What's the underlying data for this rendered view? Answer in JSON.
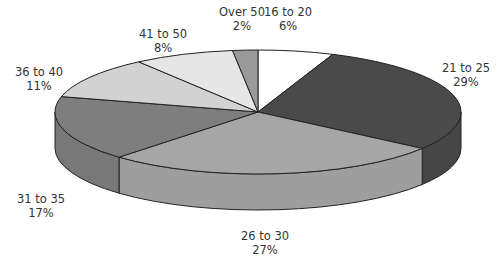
{
  "chart_data": {
    "type": "pie",
    "style": "3d",
    "title": "",
    "categories": [
      "16 to 20",
      "21 to 25",
      "26 to 30",
      "31 to 35",
      "36 to 40",
      "41 to 50",
      "Over 50"
    ],
    "values": [
      6,
      29,
      27,
      17,
      11,
      8,
      2
    ],
    "unit": "%",
    "colors": [
      "#ffffff",
      "#4a4a4a",
      "#a6a6a6",
      "#7e7e7e",
      "#d2d2d2",
      "#e6e6e6",
      "#9a9a9a"
    ],
    "labels": [
      {
        "name": "16 to 20",
        "pct": "6%"
      },
      {
        "name": "21 to 25",
        "pct": "29%"
      },
      {
        "name": "26 to 30",
        "pct": "27%"
      },
      {
        "name": "31 to 35",
        "pct": "17%"
      },
      {
        "name": "36 to 40",
        "pct": "11%"
      },
      {
        "name": "41 to 50",
        "pct": "8%"
      },
      {
        "name": "Over 50",
        "pct": "2%"
      }
    ]
  }
}
